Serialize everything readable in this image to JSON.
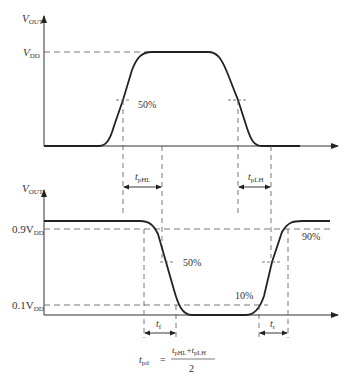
{
  "top_plot": {
    "y_axis_label": "V",
    "y_axis_sub": "OUT",
    "vdd_label": "V",
    "vdd_sub": "DD",
    "mark_50": "50%",
    "tphl_label": "t",
    "tphl_sub": "pHL",
    "tplh_label": "t",
    "tplh_sub": "pLH"
  },
  "bottom_plot": {
    "y_axis_label": "V",
    "y_axis_sub": "OUT",
    "level_09": "0.9V",
    "level_09_sub": "DD",
    "level_01": "0.1V",
    "level_01_sub": "DD",
    "mark_90": "90%",
    "mark_50": "50%",
    "mark_10": "10%",
    "tf_label": "t",
    "tf_sub": "f",
    "tr_label": "t",
    "tr_sub": "r"
  },
  "formula": {
    "lhs": "t",
    "lhs_sub": "pd",
    "equals": "=",
    "num_a": "t",
    "num_a_sub": "pHL",
    "plus": "+",
    "num_b": "t",
    "num_b_sub": "pLH",
    "denominator": "2"
  },
  "colors": {
    "stroke": "#222222",
    "dash": "#555555",
    "text": "#333333"
  }
}
